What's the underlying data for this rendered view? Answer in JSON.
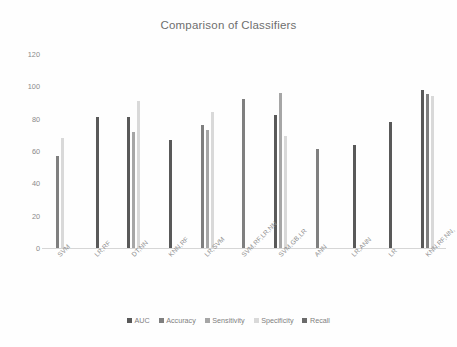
{
  "chart_data": {
    "type": "bar",
    "title": "Comparison of Classifiers",
    "xlabel": "",
    "ylabel": "",
    "ylim": [
      0,
      120
    ],
    "yticks": [
      0,
      20,
      40,
      60,
      80,
      100,
      120
    ],
    "grid": false,
    "legend_position": "bottom",
    "categories": [
      "SVM",
      "LR,RF",
      "DT,NN",
      "KNN,RF",
      "LR,SVM",
      "SVM,RF,LR,NN",
      "SVM,GB,LR",
      "ANN",
      "LR,ANN",
      "LR",
      "KNN,RF,NN,"
    ],
    "series": [
      {
        "name": "AUC",
        "color": "#595959",
        "values": [
          null,
          81,
          81,
          67,
          null,
          null,
          82,
          null,
          64,
          78,
          98
        ]
      },
      {
        "name": "Accuracy",
        "color": "#7f7f7f",
        "values": [
          57,
          null,
          null,
          null,
          76,
          92,
          null,
          61,
          null,
          null,
          95
        ]
      },
      {
        "name": "Sensitivity",
        "color": "#a6a6a6",
        "values": [
          null,
          null,
          72,
          null,
          73,
          null,
          96,
          null,
          null,
          null,
          null
        ]
      },
      {
        "name": "Specificity",
        "color": "#d9d9d9",
        "values": [
          68,
          null,
          91,
          null,
          84,
          null,
          69,
          null,
          null,
          null,
          94
        ]
      },
      {
        "name": "Recall",
        "color": "#6b6b6b",
        "values": [
          null,
          null,
          null,
          null,
          null,
          null,
          null,
          null,
          null,
          null,
          null
        ]
      }
    ]
  },
  "legend": {
    "items": [
      {
        "label": "AUC",
        "color": "#595959"
      },
      {
        "label": "Accuracy",
        "color": "#7f7f7f"
      },
      {
        "label": "Sensitivity",
        "color": "#a6a6a6"
      },
      {
        "label": "Specificity",
        "color": "#d9d9d9"
      },
      {
        "label": "Recall",
        "color": "#6b6b6b"
      }
    ]
  }
}
